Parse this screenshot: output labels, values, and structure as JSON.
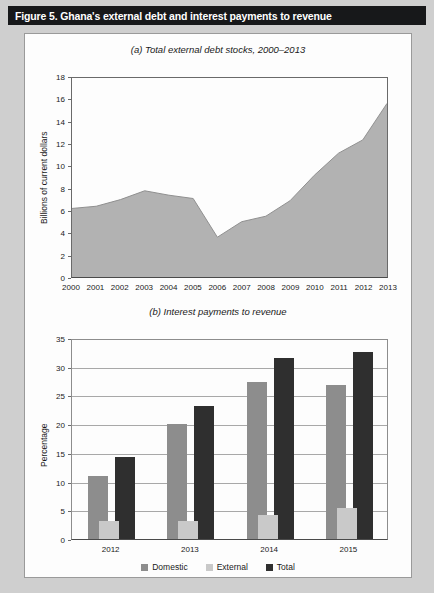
{
  "figure": {
    "title": "Figure 5. Ghana's external debt and interest payments to revenue",
    "banner_color": "#17181a",
    "banner_text_color": "#ffffff",
    "page_background": "#cfcfcf",
    "panel_background": "#fdfdfd"
  },
  "chart_data": [
    {
      "id": "a",
      "type": "area",
      "title": "(a) Total external debt stocks, 2000–2013",
      "xlabel": "",
      "ylabel": "Billions of current dollars",
      "ylim": [
        0,
        18
      ],
      "ytick_step": 2,
      "yticks": [
        "0",
        "2",
        "4",
        "6",
        "8",
        "10",
        "12",
        "14",
        "16",
        "18"
      ],
      "grid": false,
      "categories": [
        "2000",
        "2001",
        "2002",
        "2003",
        "2004",
        "2005",
        "2006",
        "2007",
        "2008",
        "2009",
        "2010",
        "2011",
        "2012",
        "2013"
      ],
      "values": [
        6.2,
        6.4,
        7.0,
        7.8,
        7.4,
        7.1,
        3.6,
        5.0,
        5.5,
        6.9,
        9.2,
        11.2,
        12.4,
        15.7
      ],
      "series_name": "Total external debt stocks",
      "area_color": "#b2b2b2",
      "line_color": "#8f8f8f"
    },
    {
      "id": "b",
      "type": "bar",
      "title": "(b) Interest payments to revenue",
      "xlabel": "",
      "ylabel": "Percentage",
      "ylim": [
        0,
        35
      ],
      "ytick_step": 5,
      "yticks": [
        "0",
        "5",
        "10",
        "15",
        "20",
        "25",
        "30",
        "35"
      ],
      "grid": true,
      "categories": [
        "2012",
        "2013",
        "2014",
        "2015"
      ],
      "series": [
        {
          "name": "Domestic",
          "color": "#8d8d8d",
          "values": [
            10.9,
            20.1,
            27.3,
            26.9
          ]
        },
        {
          "name": "External",
          "color": "#c9c9c9",
          "values": [
            3.2,
            3.1,
            4.1,
            5.4
          ]
        },
        {
          "name": "Total",
          "color": "#2f2f2f",
          "values": [
            14.2,
            23.2,
            31.5,
            32.5
          ]
        }
      ],
      "legend_position": "bottom"
    }
  ]
}
